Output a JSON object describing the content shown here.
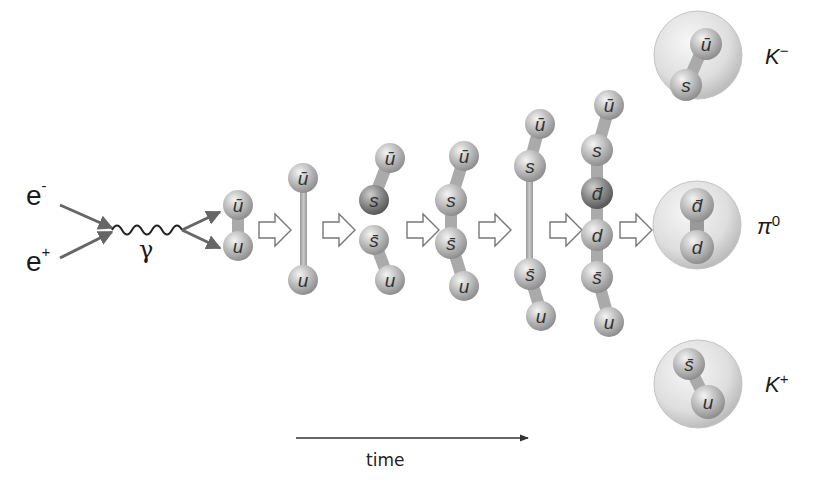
{
  "diagram": {
    "type": "process-flow",
    "colors": {
      "background": "#ffffff",
      "bead": "#b8b8b8",
      "bead_dark": "#7a7a7a",
      "arrow": "#666666",
      "hadron_shell": "#d9d9d9"
    },
    "incoming": {
      "electron": {
        "base": "e",
        "sup": "-"
      },
      "positron": {
        "base": "e",
        "sup": "+"
      },
      "photon": "γ"
    },
    "stages": [
      {
        "id": "stage-1",
        "quarks": [
          "ū",
          "u"
        ],
        "bond": "short"
      },
      {
        "id": "stage-2",
        "quarks": [
          "ū",
          "u"
        ],
        "bond": "stretched string"
      },
      {
        "id": "stage-3",
        "quarks": [
          "ū",
          "s",
          "s̄",
          "u"
        ],
        "bond": "split into two pairs"
      },
      {
        "id": "stage-4",
        "quarks": [
          "ū",
          "s",
          "s̄",
          "u"
        ],
        "bond": "chain"
      },
      {
        "id": "stage-5",
        "quarks": [
          "ū",
          "s",
          "s̄",
          "u"
        ],
        "bond": "stretched string between s and s̄"
      },
      {
        "id": "stage-6",
        "quarks": [
          "ū",
          "s",
          "d̄",
          "d",
          "s̄",
          "u"
        ],
        "bond": "chain"
      }
    ],
    "hadrons": [
      {
        "id": "k-minus",
        "quarks": [
          "ū",
          "s"
        ],
        "name": {
          "base": "K",
          "sup": "−"
        }
      },
      {
        "id": "pi-zero",
        "quarks": [
          "d̄",
          "d"
        ],
        "name": {
          "base": "π",
          "sup": "0"
        }
      },
      {
        "id": "k-plus",
        "quarks": [
          "s̄",
          "u"
        ],
        "name": {
          "base": "K",
          "sup": "+"
        }
      }
    ],
    "axis": {
      "label": "time",
      "direction": "left-to-right"
    }
  }
}
